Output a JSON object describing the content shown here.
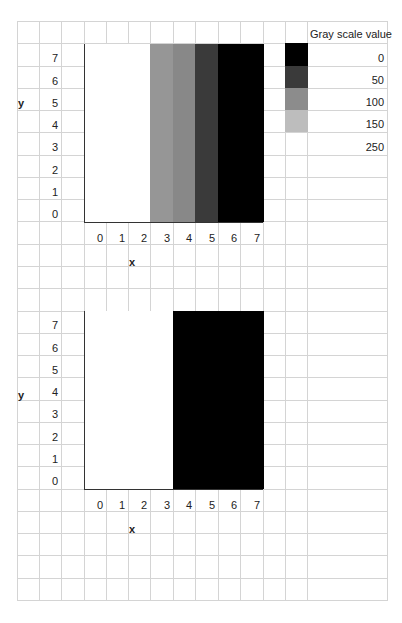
{
  "grid": {
    "col_x": [
      17,
      39,
      61,
      84,
      106,
      128,
      150,
      173,
      195,
      218,
      240,
      263,
      285,
      307,
      387
    ],
    "row_top": 21,
    "row_height": 22.27,
    "row_count": 26,
    "line_color": "#d4d4d4"
  },
  "legend": {
    "title": "Gray scale value",
    "items": [
      {
        "label": "0",
        "value": 0,
        "color": "#000000"
      },
      {
        "label": "50",
        "value": 50,
        "color": "#3a3a3a"
      },
      {
        "label": "100",
        "value": 100,
        "color": "#8c8c8c"
      },
      {
        "label": "150",
        "value": 150,
        "color": "#bdbdbd"
      },
      {
        "label": "250",
        "value": 250,
        "color": "#ffffff"
      }
    ]
  },
  "chart_data": [
    {
      "type": "heatmap",
      "title": "",
      "xlabel": "x",
      "ylabel": "y",
      "x_ticks": [
        "0",
        "1",
        "2",
        "3",
        "4",
        "5",
        "6",
        "7"
      ],
      "y_ticks": [
        "0",
        "1",
        "2",
        "3",
        "4",
        "5",
        "6",
        "7"
      ],
      "xlim": [
        0,
        7
      ],
      "ylim": [
        0,
        7
      ],
      "grid": true,
      "legend_position": "right",
      "columns": [
        {
          "x": 0,
          "gray": 250,
          "color": "#ffffff"
        },
        {
          "x": 1,
          "gray": 250,
          "color": "#ffffff"
        },
        {
          "x": 2,
          "gray": 250,
          "color": "#ffffff"
        },
        {
          "x": 3,
          "gray": 100,
          "color": "#969696"
        },
        {
          "x": 4,
          "gray": 100,
          "color": "#888888"
        },
        {
          "x": 5,
          "gray": 50,
          "color": "#3a3a3a"
        },
        {
          "x": 6,
          "gray": 0,
          "color": "#000000"
        },
        {
          "x": 7,
          "gray": 0,
          "color": "#000000"
        }
      ],
      "note": "Each column x has constant gray value across all y (0-7)"
    },
    {
      "type": "heatmap",
      "title": "",
      "xlabel": "x",
      "ylabel": "y",
      "x_ticks": [
        "0",
        "1",
        "2",
        "3",
        "4",
        "5",
        "6",
        "7"
      ],
      "y_ticks": [
        "0",
        "1",
        "2",
        "3",
        "4",
        "5",
        "6",
        "7"
      ],
      "xlim": [
        0,
        7
      ],
      "ylim": [
        0,
        7
      ],
      "grid": true,
      "columns": [
        {
          "x": 0,
          "gray": 250,
          "color": "#ffffff"
        },
        {
          "x": 1,
          "gray": 250,
          "color": "#ffffff"
        },
        {
          "x": 2,
          "gray": 250,
          "color": "#ffffff"
        },
        {
          "x": 3,
          "gray": 250,
          "color": "#ffffff"
        },
        {
          "x": 4,
          "gray": 0,
          "color": "#000000"
        },
        {
          "x": 5,
          "gray": 0,
          "color": "#000000"
        },
        {
          "x": 6,
          "gray": 0,
          "color": "#000000"
        },
        {
          "x": 7,
          "gray": 0,
          "color": "#000000"
        }
      ],
      "note": "Thresholded version: x<=3 white, x>=4 black"
    }
  ],
  "charts_layout": [
    {
      "top": 44,
      "bottom": 222,
      "tick_label_y": 232,
      "xlabel_y": 256,
      "ylabel_y": 97
    },
    {
      "top": 311,
      "bottom": 489,
      "tick_label_y": 499,
      "xlabel_y": 523,
      "ylabel_y": 389
    }
  ]
}
